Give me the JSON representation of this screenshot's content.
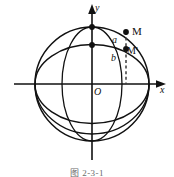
{
  "figure": {
    "caption": "图 2-3-1",
    "axes": {
      "x_label": "x",
      "y_label": "y",
      "origin_label": "O"
    },
    "points": [
      {
        "id": "M",
        "label": "M",
        "on": "circle",
        "x": 126,
        "y": 33
      },
      {
        "id": "Mp",
        "label": "M'",
        "on": "ellipse",
        "x": 126,
        "y": 49
      },
      {
        "id": "Ctop",
        "label": "",
        "on": "circle-top",
        "x": 92,
        "y": 27
      },
      {
        "id": "Etop",
        "label": "",
        "on": "ellipse-top",
        "x": 92,
        "y": 45
      }
    ],
    "segments": [
      {
        "id": "a",
        "label": "a",
        "from": "Ctop",
        "to": "M",
        "note": "arc-chord upper"
      },
      {
        "id": "b",
        "label": "b",
        "from": "Etop",
        "to": "Mp",
        "note": "arc-chord lower"
      }
    ],
    "curves": {
      "circle_radius": 57,
      "ellipse_semi_minor": 40,
      "center": {
        "x": 92,
        "y": 84
      }
    },
    "colors": {
      "stroke": "#111111",
      "dashed": "#4a4a4a",
      "background": "#ffffff",
      "caption": "#6b6b6b"
    }
  }
}
